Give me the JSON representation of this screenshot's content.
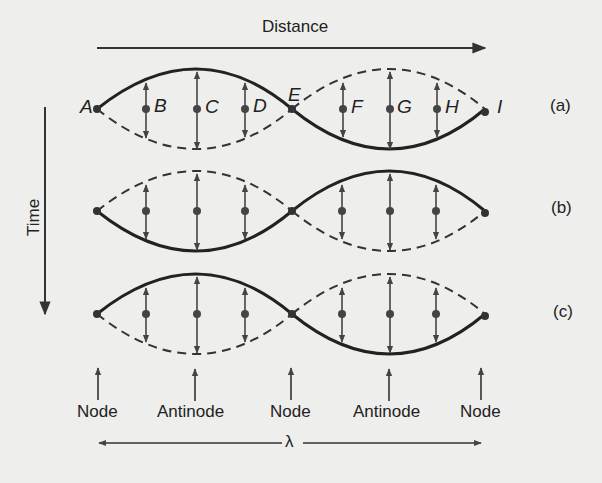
{
  "title_axis": {
    "distance_label": "Distance",
    "time_label": "Time"
  },
  "points": {
    "labels": [
      "A",
      "B",
      "C",
      "D",
      "E",
      "F",
      "G",
      "H",
      "I"
    ]
  },
  "rows": [
    {
      "tag": "(a)"
    },
    {
      "tag": "(b)"
    },
    {
      "tag": "(c)"
    }
  ],
  "markers": [
    {
      "label": "Node"
    },
    {
      "label": "Antinode"
    },
    {
      "label": "Node"
    },
    {
      "label": "Antinode"
    },
    {
      "label": "Node"
    }
  ],
  "wavelength": {
    "symbol": "λ"
  },
  "colors": {
    "ink": "#222222",
    "background": "#eeeeec"
  }
}
